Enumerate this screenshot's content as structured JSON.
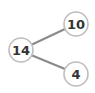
{
  "diagram": {
    "type": "number-bond",
    "whole": {
      "label": "14",
      "cx": 21,
      "cy": 50
    },
    "parts": [
      {
        "label": "10",
        "cx": 76,
        "cy": 24
      },
      {
        "label": "4",
        "cx": 76,
        "cy": 74
      }
    ],
    "radius": 12,
    "colors": {
      "line": "#8a8a8a",
      "circle_stroke": "#bdbdbd",
      "circle_fill": "#ffffff",
      "text": "#333333"
    }
  }
}
